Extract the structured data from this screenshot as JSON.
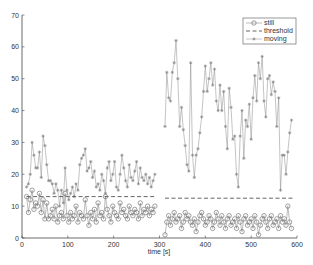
{
  "chart_data": {
    "type": "line",
    "title": "",
    "xlabel": "time [s]",
    "ylabel": "",
    "xlim": [
      0,
      600
    ],
    "ylim": [
      0,
      70
    ],
    "x_ticks": [
      "0",
      "100",
      "200",
      "300",
      "400",
      "500",
      "600"
    ],
    "y_ticks": [
      "0",
      "10",
      "20",
      "30",
      "40",
      "50",
      "60",
      "70"
    ],
    "grid": false,
    "legend_position": "upper right",
    "legend": [
      "still",
      "threshold",
      "moving"
    ],
    "series": [
      {
        "name": "still",
        "marker": "circle",
        "color": "#777777",
        "segments": [
          {
            "x": [
              10,
              14,
              18,
              22,
              26,
              30,
              34,
              38,
              42,
              46,
              50,
              54,
              58,
              62,
              66,
              70,
              74,
              78,
              82,
              86,
              90,
              94,
              98,
              102,
              106,
              110,
              114,
              118,
              122,
              126,
              130,
              134,
              138,
              142,
              146,
              150,
              154,
              158,
              162,
              166,
              170,
              174,
              178,
              182,
              186,
              190,
              194,
              198,
              202,
              206,
              210,
              214,
              218,
              222,
              226,
              230,
              234,
              238,
              242,
              246,
              250,
              254,
              258,
              262,
              266,
              270,
              274,
              278,
              282,
              286,
              290
            ],
            "y": [
              13,
              8,
              12,
              15,
              9,
              11,
              10,
              14,
              8,
              12,
              6,
              11,
              6,
              7,
              9,
              6,
              10,
              5,
              7,
              8,
              6,
              14,
              7,
              5,
              8,
              6,
              7,
              10,
              5,
              8,
              7,
              6,
              12,
              7,
              4,
              8,
              6,
              9,
              5,
              11,
              7,
              8,
              6,
              13,
              9,
              7,
              5,
              10,
              8,
              7,
              6,
              11,
              8,
              9,
              7,
              6,
              10,
              8,
              7,
              9,
              8,
              6,
              11,
              7,
              9,
              8,
              10,
              7,
              9,
              8,
              10
            ]
          },
          {
            "x": [
              312,
              316,
              320,
              324,
              328,
              332,
              336,
              340,
              344,
              348,
              352,
              356,
              360,
              364,
              368,
              372,
              376,
              380,
              384,
              388,
              392,
              396,
              400,
              404,
              408,
              412,
              416,
              420,
              424,
              428,
              432,
              436,
              440,
              444,
              448,
              452,
              456,
              460,
              464,
              468,
              472,
              476,
              480,
              484,
              488,
              492,
              496,
              500,
              504,
              508,
              512,
              516,
              520,
              524,
              528,
              532,
              536,
              540,
              544,
              548,
              552,
              556,
              560,
              564,
              568,
              572,
              576,
              580,
              584,
              588
            ],
            "y": [
              1,
              5,
              7,
              4,
              6,
              8,
              5,
              6,
              7,
              3,
              5,
              8,
              6,
              7,
              5,
              4,
              6,
              2,
              5,
              7,
              8,
              6,
              4,
              5,
              7,
              6,
              3,
              5,
              8,
              6,
              4,
              7,
              5,
              3,
              6,
              7,
              4,
              5,
              6,
              3,
              7,
              5,
              2,
              6,
              7,
              4,
              5,
              6,
              3,
              7,
              5,
              1,
              4,
              6,
              7,
              5,
              3,
              6,
              7,
              4,
              5,
              6,
              3,
              7,
              5,
              6,
              4,
              10,
              5,
              3
            ]
          }
        ]
      },
      {
        "name": "threshold",
        "style": "dashed",
        "color": "#555555",
        "segments": [
          {
            "x": [
              10,
              290
            ],
            "y": [
              13,
              13
            ]
          },
          {
            "x": [
              312,
              590
            ],
            "y": [
              12.5,
              12.5
            ]
          }
        ]
      },
      {
        "name": "moving",
        "marker": "asterisk",
        "color": "#888888",
        "segments": [
          {
            "x": [
              10,
              14,
              18,
              22,
              26,
              30,
              34,
              38,
              42,
              46,
              50,
              54,
              58,
              62,
              66,
              70,
              74,
              78,
              82,
              86,
              90,
              94,
              98,
              102,
              106,
              110,
              114,
              118,
              122,
              126,
              130,
              134,
              138,
              142,
              146,
              150,
              154,
              158,
              162,
              166,
              170,
              174,
              178,
              182,
              186,
              190,
              194,
              198,
              202,
              206,
              210,
              214,
              218,
              222,
              226,
              230,
              234,
              238,
              242,
              246,
              250,
              254,
              258,
              262,
              266,
              270,
              274,
              278,
              282,
              286,
              290
            ],
            "y": [
              16,
              17,
              20,
              30,
              26,
              22,
              22,
              27,
              19,
              32,
              29,
              23,
              18,
              18,
              17,
              14,
              17,
              15,
              10,
              15,
              11,
              22,
              15,
              12,
              14,
              16,
              13,
              17,
              15,
              23,
              25,
              26,
              28,
              21,
              22,
              24,
              19,
              21,
              16,
              17,
              15,
              20,
              18,
              14,
              22,
              24,
              18,
              20,
              24,
              16,
              15,
              20,
              26,
              22,
              18,
              16,
              23,
              19,
              18,
              21,
              24,
              17,
              22,
              19,
              18,
              20,
              17,
              19,
              16,
              18,
              20
            ]
          },
          {
            "x": [
              312,
              316,
              320,
              324,
              328,
              332,
              336,
              340,
              344,
              348,
              352,
              356,
              360,
              364,
              368,
              372,
              376,
              380,
              384,
              388,
              392,
              396,
              400,
              404,
              408,
              412,
              416,
              420,
              424,
              428,
              432,
              436,
              440,
              444,
              448,
              452,
              456,
              460,
              464,
              468,
              472,
              476,
              480,
              484,
              488,
              492,
              496,
              500,
              504,
              508,
              512,
              516,
              520,
              524,
              528,
              532,
              536,
              540,
              544,
              548,
              552,
              556,
              560,
              564,
              568,
              572,
              576,
              580,
              584,
              588
            ],
            "y": [
              35,
              52,
              44,
              43,
              52,
              55,
              62,
              50,
              35,
              41,
              34,
              29,
              23,
              21,
              55,
              26,
              19,
              26,
              28,
              33,
              38,
              46,
              54,
              46,
              50,
              55,
              48,
              53,
              43,
              40,
              48,
              40,
              46,
              35,
              28,
              47,
              41,
              31,
              32,
              20,
              16,
              32,
              40,
              25,
              37,
              35,
              42,
              31,
              44,
              51,
              43,
              55,
              50,
              57,
              43,
              38,
              50,
              51,
              45,
              49,
              46,
              35,
              44,
              15,
              26,
              26,
              20,
              27,
              33,
              37
            ]
          }
        ]
      }
    ]
  }
}
